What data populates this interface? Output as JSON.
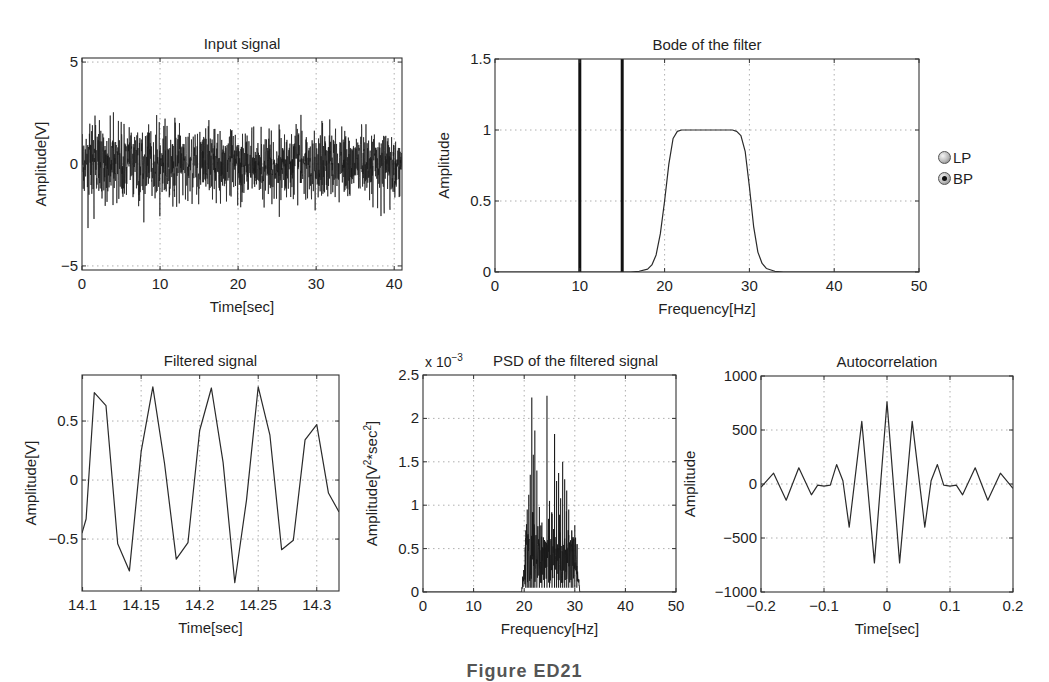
{
  "figure": {
    "caption_partial": "Figure ED21",
    "controls": {
      "filter_type": {
        "options": [
          {
            "label": "LP",
            "selected": false
          },
          {
            "label": "BP",
            "selected": true
          }
        ]
      }
    }
  },
  "chart_data": [
    {
      "id": "input",
      "type": "line",
      "title": "Input signal",
      "xlabel": "Time[sec]",
      "ylabel": "Amplitude[V]",
      "xlim": [
        0,
        41
      ],
      "ylim": [
        -5.2,
        5.2
      ],
      "xticks": [
        0,
        10,
        20,
        30,
        40
      ],
      "yticks": [
        -5,
        0,
        5
      ],
      "grid": true,
      "description": "White noise, approx. zero mean, std ~1 V, peaks between about -4.2 and +3.5 V",
      "series": [
        {
          "name": "input",
          "generator": "noise",
          "n": 1600,
          "std": 0.95,
          "seed": 7
        }
      ]
    },
    {
      "id": "bode",
      "type": "line",
      "title": "Bode of the filter",
      "xlabel": "Frequency[Hz]",
      "ylabel": "Amplitude",
      "xlim": [
        0,
        50
      ],
      "ylim": [
        0,
        1.5
      ],
      "xticks": [
        0,
        10,
        20,
        30,
        40,
        50
      ],
      "yticks": [
        0,
        0.5,
        1,
        1.5
      ],
      "grid": true,
      "vlines": [
        10,
        15
      ],
      "series": [
        {
          "name": "BP magnitude",
          "x": [
            0,
            16,
            17,
            18,
            18.5,
            19,
            19.5,
            20,
            20.5,
            21,
            21.5,
            22,
            28,
            28.5,
            29,
            29.5,
            30,
            30.5,
            31,
            31.5,
            32,
            33,
            34,
            50
          ],
          "y": [
            0,
            0,
            0.005,
            0.02,
            0.05,
            0.12,
            0.27,
            0.5,
            0.76,
            0.94,
            0.99,
            1.0,
            1.0,
            0.99,
            0.96,
            0.85,
            0.6,
            0.32,
            0.14,
            0.06,
            0.025,
            0.005,
            0,
            0
          ]
        }
      ]
    },
    {
      "id": "filtered",
      "type": "line",
      "title": "Filtered signal",
      "xlabel": "Time[sec]",
      "ylabel": "Amplitude[V]",
      "xlim": [
        14.0995,
        14.319
      ],
      "ylim": [
        -0.94,
        0.89
      ],
      "xticks": [
        14.1,
        14.15,
        14.2,
        14.25,
        14.3
      ],
      "xticklabels": [
        "14.1",
        "14.15",
        "14.2",
        "14.25",
        "14.3"
      ],
      "yticks": [
        -0.5,
        0,
        0.5
      ],
      "grid": true,
      "series": [
        {
          "name": "filtered",
          "x": [
            14.0995,
            14.103,
            14.11,
            14.12,
            14.13,
            14.14,
            14.15,
            14.16,
            14.17,
            14.18,
            14.19,
            14.2,
            14.21,
            14.22,
            14.23,
            14.24,
            14.25,
            14.26,
            14.27,
            14.28,
            14.29,
            14.3,
            14.31,
            14.319
          ],
          "y": [
            -0.45,
            -0.33,
            0.74,
            0.63,
            -0.54,
            -0.77,
            0.24,
            0.79,
            0.14,
            -0.67,
            -0.53,
            0.42,
            0.78,
            0.15,
            -0.87,
            -0.17,
            0.79,
            0.38,
            -0.59,
            -0.51,
            0.34,
            0.47,
            -0.11,
            -0.27
          ]
        }
      ]
    },
    {
      "id": "psd",
      "type": "line",
      "title": "PSD of the filtered signal",
      "exponent_label": "x 10",
      "exponent": "−3",
      "xlabel": "Frequency[Hz]",
      "ylabel": "Amplitude[V²*sec²]",
      "xlim": [
        0,
        50
      ],
      "ylim": [
        0,
        2.5
      ],
      "xticks": [
        0,
        10,
        20,
        30,
        40,
        50
      ],
      "yticks": [
        0,
        0.5,
        1,
        1.5,
        2,
        2.5
      ],
      "grid": true,
      "description": "Dense spectrum (x1e-3) concentrated in 19.5-31 Hz band, baseline ~0.2-0.6, peaks listed",
      "band": [
        19.5,
        31
      ],
      "peaks": [
        {
          "f": 20.3,
          "v": 0.62
        },
        {
          "f": 20.6,
          "v": 0.95
        },
        {
          "f": 20.9,
          "v": 1.12
        },
        {
          "f": 21.2,
          "v": 1.35
        },
        {
          "f": 21.5,
          "v": 2.24
        },
        {
          "f": 21.8,
          "v": 1.58
        },
        {
          "f": 22.1,
          "v": 1.86
        },
        {
          "f": 22.5,
          "v": 1.4
        },
        {
          "f": 23.0,
          "v": 0.98
        },
        {
          "f": 23.5,
          "v": 0.8
        },
        {
          "f": 24.0,
          "v": 0.6
        },
        {
          "f": 24.5,
          "v": 2.26
        },
        {
          "f": 25.0,
          "v": 1.05
        },
        {
          "f": 25.5,
          "v": 0.9
        },
        {
          "f": 26.0,
          "v": 1.82
        },
        {
          "f": 26.4,
          "v": 1.28
        },
        {
          "f": 26.8,
          "v": 1.37
        },
        {
          "f": 27.2,
          "v": 1.08
        },
        {
          "f": 27.6,
          "v": 1.5
        },
        {
          "f": 28.0,
          "v": 1.3
        },
        {
          "f": 28.4,
          "v": 1.17
        },
        {
          "f": 28.8,
          "v": 0.95
        },
        {
          "f": 29.3,
          "v": 0.55
        },
        {
          "f": 29.6,
          "v": 0.62
        },
        {
          "f": 30.0,
          "v": 0.77
        },
        {
          "f": 30.4,
          "v": 0.3
        }
      ]
    },
    {
      "id": "autocorr",
      "type": "line",
      "title": "Autocorrelation",
      "xlabel": "Time[sec]",
      "ylabel": "Amplitude",
      "xlim": [
        -0.2,
        0.2
      ],
      "ylim": [
        -1000,
        1000
      ],
      "xticks": [
        -0.2,
        -0.1,
        0,
        0.1,
        0.2
      ],
      "xticklabels": [
        "−0.2",
        "−0.1",
        "0",
        "0.1",
        "0.2"
      ],
      "yticks": [
        -1000,
        -500,
        0,
        500,
        1000
      ],
      "yticklabels": [
        "−1000",
        "−500",
        "0",
        "500",
        "1000"
      ],
      "grid": true,
      "series": [
        {
          "name": "autocorrelation",
          "x": [
            -0.2,
            -0.18,
            -0.16,
            -0.14,
            -0.12,
            -0.11,
            -0.1,
            -0.09,
            -0.08,
            -0.07,
            -0.06,
            -0.04,
            -0.02,
            0,
            0.02,
            0.04,
            0.06,
            0.07,
            0.08,
            0.09,
            0.1,
            0.11,
            0.12,
            0.14,
            0.16,
            0.18,
            0.2
          ],
          "y": [
            -30,
            100,
            -150,
            150,
            -100,
            -10,
            -20,
            -10,
            180,
            30,
            -400,
            580,
            -730,
            760,
            -730,
            580,
            -400,
            30,
            180,
            -10,
            -20,
            -10,
            -100,
            150,
            -150,
            100,
            -40
          ]
        }
      ]
    }
  ]
}
